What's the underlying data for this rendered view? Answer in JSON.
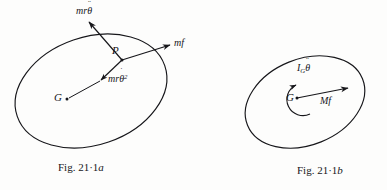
{
  "page": {
    "background_color": "#fdfdfc",
    "ink_color": "#16161a",
    "width": 387,
    "height": 190
  },
  "figures": [
    {
      "id": "fig-21-1a",
      "caption_prefix": "Fig. 21·1",
      "caption_suffix": "a",
      "caption_full": "Fig. 21·1a",
      "body_shape": "ellipse",
      "points": [
        {
          "name": "G",
          "label": "G",
          "role": "center-of-mass"
        },
        {
          "name": "P",
          "label": "P",
          "role": "point-on-body"
        }
      ],
      "vectors": [
        {
          "name": "tangential-inertia-force",
          "label_plain": "mrθ̈",
          "label_parts": {
            "coef": "mr",
            "symbol": "θ",
            "accent": "¨",
            "exponent": ""
          },
          "direction": "up-left",
          "origin": "P"
        },
        {
          "name": "force-mf",
          "label_plain": "mf",
          "label_parts": {
            "coef": "mf",
            "symbol": "",
            "accent": "",
            "exponent": ""
          },
          "direction": "up-right",
          "origin": "P"
        },
        {
          "name": "centripetal-inertia-force",
          "label_plain": "mrθ̇²",
          "label_parts": {
            "coef": "mr",
            "symbol": "θ",
            "accent": "˙",
            "exponent": "2"
          },
          "direction": "down-left-toward-G",
          "origin": "P"
        }
      ]
    },
    {
      "id": "fig-21-1b",
      "caption_prefix": "Fig. 21·1",
      "caption_suffix": "b",
      "caption_full": "Fig. 21·1b",
      "body_shape": "ellipse",
      "points": [
        {
          "name": "G",
          "label": "G",
          "role": "center-of-mass"
        }
      ],
      "vectors": [
        {
          "name": "resultant-force-Mf",
          "label_plain": "Mf",
          "label_parts": {
            "coef": "Mf",
            "symbol": "",
            "accent": "",
            "exponent": ""
          },
          "direction": "right",
          "origin": "G"
        }
      ],
      "moments": [
        {
          "name": "inertia-couple",
          "label_plain": "I_Gθ̈",
          "label_parts": {
            "coef": "I",
            "subscript": "G",
            "symbol": "θ",
            "accent": "¨"
          },
          "sense": "counterclockwise",
          "origin": "G"
        }
      ]
    }
  ]
}
